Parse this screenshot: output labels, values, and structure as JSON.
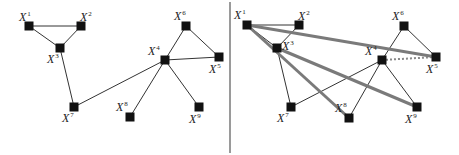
{
  "panels": [
    {
      "id": "left",
      "nodes": [
        {
          "id": "1",
          "label": "X",
          "sup": "1"
        },
        {
          "id": "2",
          "label": "X",
          "sup": "2"
        },
        {
          "id": "3",
          "label": "X",
          "sup": "3"
        },
        {
          "id": "4",
          "label": "X",
          "sup": "4"
        },
        {
          "id": "5",
          "label": "X",
          "sup": "5"
        },
        {
          "id": "6",
          "label": "X",
          "sup": "6"
        },
        {
          "id": "7",
          "label": "X",
          "sup": "7"
        },
        {
          "id": "8",
          "label": "X",
          "sup": "8"
        },
        {
          "id": "9",
          "label": "X",
          "sup": "9"
        }
      ],
      "edges": [
        {
          "from": "1",
          "to": "2",
          "style": "thin"
        },
        {
          "from": "1",
          "to": "3",
          "style": "thin"
        },
        {
          "from": "2",
          "to": "3",
          "style": "thin"
        },
        {
          "from": "3",
          "to": "7",
          "style": "thin"
        },
        {
          "from": "7",
          "to": "4",
          "style": "thin"
        },
        {
          "from": "4",
          "to": "6",
          "style": "thin"
        },
        {
          "from": "6",
          "to": "5",
          "style": "thin"
        },
        {
          "from": "4",
          "to": "5",
          "style": "thin"
        },
        {
          "from": "4",
          "to": "8",
          "style": "thin"
        },
        {
          "from": "4",
          "to": "9",
          "style": "thin"
        }
      ]
    },
    {
      "id": "right",
      "nodes": [
        {
          "id": "1",
          "label": "X",
          "sup": "1"
        },
        {
          "id": "2",
          "label": "X",
          "sup": "2"
        },
        {
          "id": "3",
          "label": "X",
          "sup": "3"
        },
        {
          "id": "4",
          "label": "X",
          "sup": "4"
        },
        {
          "id": "5",
          "label": "X",
          "sup": "5"
        },
        {
          "id": "6",
          "label": "X",
          "sup": "6"
        },
        {
          "id": "7",
          "label": "X",
          "sup": "7"
        },
        {
          "id": "8",
          "label": "X",
          "sup": "8"
        },
        {
          "id": "9",
          "label": "X",
          "sup": "9"
        }
      ],
      "edges": [
        {
          "from": "1",
          "to": "2",
          "style": "thin"
        },
        {
          "from": "1",
          "to": "3",
          "style": "thin"
        },
        {
          "from": "2",
          "to": "3",
          "style": "thin"
        },
        {
          "from": "3",
          "to": "7",
          "style": "thin"
        },
        {
          "from": "7",
          "to": "4",
          "style": "thin"
        },
        {
          "from": "4",
          "to": "6",
          "style": "thin"
        },
        {
          "from": "6",
          "to": "5",
          "style": "thin"
        },
        {
          "from": "4",
          "to": "5",
          "style": "dotted"
        },
        {
          "from": "4",
          "to": "8",
          "style": "thin"
        },
        {
          "from": "4",
          "to": "9",
          "style": "thin"
        },
        {
          "from": "1",
          "to": "5",
          "style": "thick"
        },
        {
          "from": "1",
          "to": "8",
          "style": "thick"
        },
        {
          "from": "3",
          "to": "9",
          "style": "thick"
        }
      ]
    }
  ],
  "colors": {
    "node": "#111111",
    "thin_edge": "#333333",
    "thick_edge": "#7a7a7a",
    "dotted_edge": "#888888",
    "divider": "#9a9a9a"
  }
}
